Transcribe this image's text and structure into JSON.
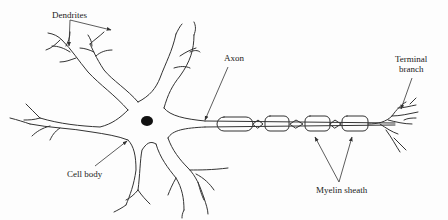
{
  "diagram": {
    "type": "labeled-anatomical-illustration",
    "labels": {
      "dendrites": "Dendrites",
      "axon": "Axon",
      "terminal_branch_line1": "Terminal",
      "terminal_branch_line2": "branch",
      "cell_body": "Cell body",
      "myelin_sheath": "Myelin sheath"
    },
    "parts": [
      "Dendrites",
      "Cell body",
      "Nucleus",
      "Axon",
      "Myelin sheath",
      "Nodes",
      "Terminal branch"
    ],
    "myelin_segment_count": 4,
    "colors": {
      "ink": "#333333",
      "background": "#fdfdfd"
    }
  }
}
